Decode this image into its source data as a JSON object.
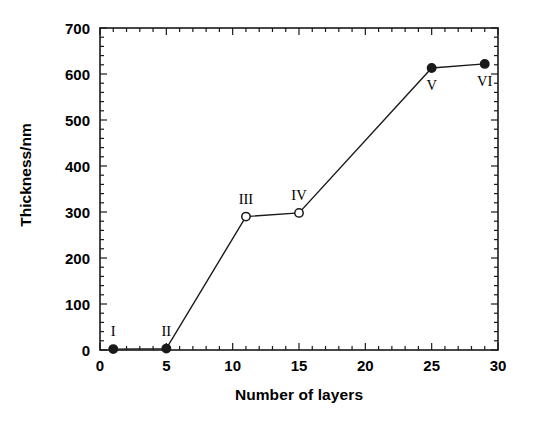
{
  "chart_data": {
    "type": "line",
    "title": "",
    "xlabel": "Number of layers",
    "ylabel": "Thickness/nm",
    "xlim": [
      0,
      30
    ],
    "ylim": [
      0,
      700
    ],
    "xticks": [
      0,
      5,
      10,
      15,
      20,
      25,
      30
    ],
    "yticks": [
      0,
      100,
      200,
      300,
      400,
      500,
      600,
      700
    ],
    "x_minor_step": 1,
    "y_minor_step": 20,
    "grid": false,
    "legend": null,
    "frame": "box",
    "tick_direction": "in",
    "series": [
      {
        "name": "Thickness vs number of layers",
        "x": [
          1,
          5,
          11,
          15,
          25,
          29
        ],
        "y": [
          2,
          3,
          290,
          298,
          613,
          622
        ],
        "marker_fill": [
          "filled",
          "filled",
          "open",
          "open",
          "filled",
          "filled"
        ],
        "line_color": "#1a1a1a",
        "marker_color": "#1a1a1a"
      }
    ],
    "annotations": [
      {
        "text": "I",
        "x": 1,
        "y": 2,
        "position": "above"
      },
      {
        "text": "II",
        "x": 5,
        "y": 3,
        "position": "above"
      },
      {
        "text": "III",
        "x": 11,
        "y": 290,
        "position": "above"
      },
      {
        "text": "IV",
        "x": 15,
        "y": 298,
        "position": "above"
      },
      {
        "text": "V",
        "x": 25,
        "y": 613,
        "position": "below"
      },
      {
        "text": "VI",
        "x": 29,
        "y": 622,
        "position": "below"
      }
    ]
  },
  "axes": {
    "y_tick_labels": [
      "0",
      "100",
      "200",
      "300",
      "400",
      "500",
      "600",
      "700"
    ],
    "x_tick_labels": [
      "0",
      "5",
      "10",
      "15",
      "20",
      "25",
      "30"
    ],
    "y_axis_title": "Thickness/nm",
    "x_axis_title": "Number of layers"
  },
  "labels": {
    "p1": "I",
    "p2": "II",
    "p3": "III",
    "p4": "IV",
    "p5": "V",
    "p6": "VI"
  },
  "colors": {
    "ink": "#1a1a1a",
    "background": "#ffffff"
  }
}
